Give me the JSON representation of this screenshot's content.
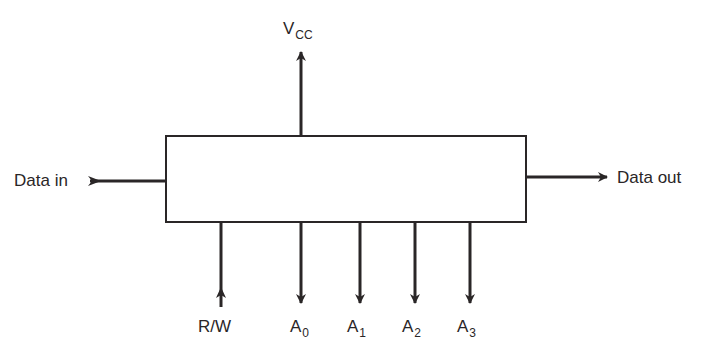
{
  "diagram": {
    "block": {
      "label": ""
    },
    "inputs": {
      "data_in": {
        "label": "Data in"
      },
      "rw": {
        "label": "R/W"
      }
    },
    "outputs": {
      "data_out": {
        "label": "Data out"
      }
    },
    "power": {
      "base": "V",
      "sub": "CC"
    },
    "address_lines": [
      {
        "base": "A",
        "sub": "0"
      },
      {
        "base": "A",
        "sub": "1"
      },
      {
        "base": "A",
        "sub": "2"
      },
      {
        "base": "A",
        "sub": "3"
      }
    ],
    "colors": {
      "ink": "#2a2627",
      "background": "#ffffff"
    }
  }
}
